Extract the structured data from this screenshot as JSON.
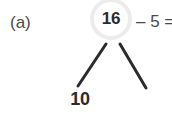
{
  "problem": {
    "part_label": "(a)",
    "equation_text": "– 5 =",
    "equation_truncated": true
  },
  "number_bond": {
    "parent": {
      "value": "16",
      "circle_stroke_color": "#ececec",
      "text_color": "#2b2b2b"
    },
    "children": [
      {
        "position": "left",
        "value": "10"
      },
      {
        "position": "right",
        "value": ""
      }
    ],
    "branch_color": "#2b2b2b",
    "branches": [
      {
        "name": "branch-left",
        "x1": 106,
        "y1": 44,
        "x2": 78,
        "y2": 86
      },
      {
        "name": "branch-right",
        "x1": 120,
        "y1": 44,
        "x2": 146,
        "y2": 88
      }
    ]
  },
  "canvas": {
    "background_color": "#ffffff",
    "width": 172,
    "height": 118
  }
}
